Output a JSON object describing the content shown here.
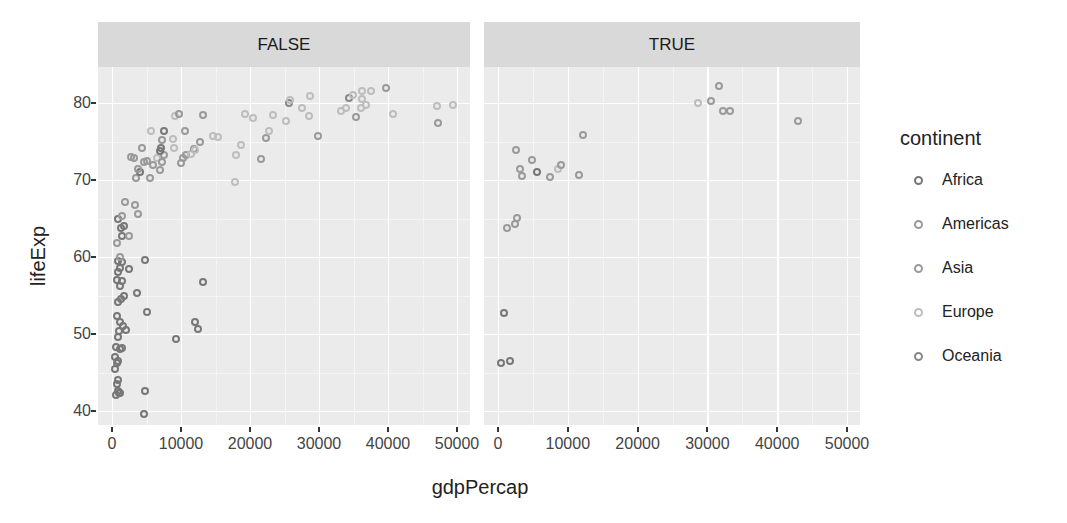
{
  "chart_data": {
    "type": "scatter",
    "title": "",
    "xlabel": "gdpPercap",
    "ylabel": "lifeExp",
    "facet_var": "",
    "facets": [
      "FALSE",
      "TRUE"
    ],
    "xlim": [
      -2000,
      52000
    ],
    "ylim": [
      38.5,
      85
    ],
    "x_ticks": [
      "0",
      "10000",
      "20000",
      "30000",
      "40000",
      "50000"
    ],
    "y_ticks": [
      "40",
      "50",
      "60",
      "70",
      "80"
    ],
    "grid": true,
    "legend": {
      "title": "continent",
      "position": "right",
      "entries": [
        {
          "name": "Africa",
          "color": "#777777"
        },
        {
          "name": "Americas",
          "color": "#999999"
        },
        {
          "name": "Asia",
          "color": "#9a9a9a"
        },
        {
          "name": "Europe",
          "color": "#bdbdbd"
        },
        {
          "name": "Oceania",
          "color": "#888888"
        }
      ]
    },
    "series": [
      {
        "facet": "FALSE",
        "points": [
          {
            "x": 600,
            "y": 42.1,
            "c": "Africa"
          },
          {
            "x": 800,
            "y": 42.6,
            "c": "Africa"
          },
          {
            "x": 1000,
            "y": 42.4,
            "c": "Africa"
          },
          {
            "x": 1200,
            "y": 42.3,
            "c": "Africa"
          },
          {
            "x": 700,
            "y": 43.5,
            "c": "Africa"
          },
          {
            "x": 900,
            "y": 44.0,
            "c": "Africa"
          },
          {
            "x": 4800,
            "y": 42.6,
            "c": "Africa"
          },
          {
            "x": 4700,
            "y": 39.6,
            "c": "Africa"
          },
          {
            "x": 500,
            "y": 45.4,
            "c": "Africa"
          },
          {
            "x": 700,
            "y": 46.2,
            "c": "Africa"
          },
          {
            "x": 400,
            "y": 47.0,
            "c": "Africa"
          },
          {
            "x": 900,
            "y": 46.5,
            "c": "Africa"
          },
          {
            "x": 600,
            "y": 48.3,
            "c": "Africa"
          },
          {
            "x": 1100,
            "y": 48.0,
            "c": "Africa"
          },
          {
            "x": 800,
            "y": 49.6,
            "c": "Africa"
          },
          {
            "x": 1500,
            "y": 48.2,
            "c": "Africa"
          },
          {
            "x": 9300,
            "y": 49.3,
            "c": "Africa"
          },
          {
            "x": 1000,
            "y": 50.4,
            "c": "Africa"
          },
          {
            "x": 1200,
            "y": 51.5,
            "c": "Africa"
          },
          {
            "x": 700,
            "y": 52.3,
            "c": "Africa"
          },
          {
            "x": 1600,
            "y": 51.0,
            "c": "Africa"
          },
          {
            "x": 2000,
            "y": 50.5,
            "c": "Africa"
          },
          {
            "x": 12000,
            "y": 51.6,
            "c": "Africa"
          },
          {
            "x": 12500,
            "y": 50.7,
            "c": "Africa"
          },
          {
            "x": 5000,
            "y": 52.9,
            "c": "Africa"
          },
          {
            "x": 900,
            "y": 54.1,
            "c": "Africa"
          },
          {
            "x": 1300,
            "y": 54.5,
            "c": "Africa"
          },
          {
            "x": 1800,
            "y": 55.0,
            "c": "Africa"
          },
          {
            "x": 3600,
            "y": 55.3,
            "c": "Africa"
          },
          {
            "x": 1100,
            "y": 56.2,
            "c": "Africa"
          },
          {
            "x": 700,
            "y": 57.0,
            "c": "Africa"
          },
          {
            "x": 13200,
            "y": 56.7,
            "c": "Africa"
          },
          {
            "x": 1400,
            "y": 56.9,
            "c": "Africa"
          },
          {
            "x": 800,
            "y": 58.0,
            "c": "Africa"
          },
          {
            "x": 2500,
            "y": 58.5,
            "c": "Africa"
          },
          {
            "x": 1200,
            "y": 58.6,
            "c": "Africa"
          },
          {
            "x": 900,
            "y": 59.5,
            "c": "Africa"
          },
          {
            "x": 1500,
            "y": 59.4,
            "c": "Africa"
          },
          {
            "x": 4800,
            "y": 59.6,
            "c": "Africa"
          },
          {
            "x": 1100,
            "y": 60.0,
            "c": "Asia"
          },
          {
            "x": 700,
            "y": 61.8,
            "c": "Asia"
          },
          {
            "x": 1500,
            "y": 62.7,
            "c": "Africa"
          },
          {
            "x": 2400,
            "y": 62.7,
            "c": "Asia"
          },
          {
            "x": 1300,
            "y": 63.8,
            "c": "Africa"
          },
          {
            "x": 1800,
            "y": 64.0,
            "c": "Africa"
          },
          {
            "x": 900,
            "y": 65.0,
            "c": "Africa"
          },
          {
            "x": 1500,
            "y": 65.3,
            "c": "Asia"
          },
          {
            "x": 3800,
            "y": 65.6,
            "c": "Asia"
          },
          {
            "x": 1900,
            "y": 67.2,
            "c": "Asia"
          },
          {
            "x": 3300,
            "y": 66.8,
            "c": "Americas"
          },
          {
            "x": 3500,
            "y": 70.3,
            "c": "Americas"
          },
          {
            "x": 5500,
            "y": 70.3,
            "c": "Asia"
          },
          {
            "x": 4100,
            "y": 71.0,
            "c": "Africa"
          },
          {
            "x": 3700,
            "y": 71.4,
            "c": "Americas"
          },
          {
            "x": 6900,
            "y": 71.3,
            "c": "Asia"
          },
          {
            "x": 5900,
            "y": 72.0,
            "c": "Americas"
          },
          {
            "x": 4700,
            "y": 72.3,
            "c": "Americas"
          },
          {
            "x": 3200,
            "y": 72.9,
            "c": "Americas"
          },
          {
            "x": 2800,
            "y": 73.0,
            "c": "Asia"
          },
          {
            "x": 5100,
            "y": 72.5,
            "c": "Americas"
          },
          {
            "x": 6500,
            "y": 72.8,
            "c": "Europe"
          },
          {
            "x": 7200,
            "y": 72.4,
            "c": "Americas"
          },
          {
            "x": 7500,
            "y": 73.3,
            "c": "Asia"
          },
          {
            "x": 4400,
            "y": 74.1,
            "c": "Asia"
          },
          {
            "x": 7000,
            "y": 73.8,
            "c": "Africa"
          },
          {
            "x": 7100,
            "y": 74.2,
            "c": "Africa"
          },
          {
            "x": 7300,
            "y": 75.2,
            "c": "Americas"
          },
          {
            "x": 5700,
            "y": 76.4,
            "c": "Europe"
          },
          {
            "x": 7500,
            "y": 76.4,
            "c": "Africa"
          },
          {
            "x": 8900,
            "y": 75.3,
            "c": "Europe"
          },
          {
            "x": 9000,
            "y": 74.2,
            "c": "Europe"
          },
          {
            "x": 10000,
            "y": 72.2,
            "c": "Americas"
          },
          {
            "x": 10300,
            "y": 72.8,
            "c": "Asia"
          },
          {
            "x": 10700,
            "y": 73.3,
            "c": "Americas"
          },
          {
            "x": 10600,
            "y": 76.4,
            "c": "Asia"
          },
          {
            "x": 11400,
            "y": 73.4,
            "c": "Europe"
          },
          {
            "x": 11900,
            "y": 74.0,
            "c": "Asia"
          },
          {
            "x": 12000,
            "y": 73.9,
            "c": "Europe"
          },
          {
            "x": 12800,
            "y": 75.0,
            "c": "Americas"
          },
          {
            "x": 9100,
            "y": 78.3,
            "c": "Europe"
          },
          {
            "x": 9700,
            "y": 78.6,
            "c": "Americas"
          },
          {
            "x": 13200,
            "y": 78.4,
            "c": "Americas"
          },
          {
            "x": 14700,
            "y": 75.7,
            "c": "Europe"
          },
          {
            "x": 15400,
            "y": 75.6,
            "c": "Europe"
          },
          {
            "x": 17800,
            "y": 69.8,
            "c": "Europe"
          },
          {
            "x": 18000,
            "y": 73.3,
            "c": "Europe"
          },
          {
            "x": 18700,
            "y": 74.5,
            "c": "Europe"
          },
          {
            "x": 19300,
            "y": 78.6,
            "c": "Europe"
          },
          {
            "x": 20500,
            "y": 78.1,
            "c": "Europe"
          },
          {
            "x": 21600,
            "y": 72.7,
            "c": "Asia"
          },
          {
            "x": 22300,
            "y": 75.5,
            "c": "Asia"
          },
          {
            "x": 22800,
            "y": 76.4,
            "c": "Europe"
          },
          {
            "x": 23300,
            "y": 78.5,
            "c": "Europe"
          },
          {
            "x": 25200,
            "y": 77.6,
            "c": "Europe"
          },
          {
            "x": 25600,
            "y": 80.0,
            "c": "Oceania"
          },
          {
            "x": 25800,
            "y": 80.4,
            "c": "Europe"
          },
          {
            "x": 27500,
            "y": 79.3,
            "c": "Europe"
          },
          {
            "x": 28700,
            "y": 80.9,
            "c": "Europe"
          },
          {
            "x": 28600,
            "y": 78.3,
            "c": "Europe"
          },
          {
            "x": 29800,
            "y": 75.7,
            "c": "Asia"
          },
          {
            "x": 33200,
            "y": 79.0,
            "c": "Europe"
          },
          {
            "x": 33900,
            "y": 79.3,
            "c": "Europe"
          },
          {
            "x": 34400,
            "y": 80.7,
            "c": "Oceania"
          },
          {
            "x": 34900,
            "y": 81.0,
            "c": "Europe"
          },
          {
            "x": 35300,
            "y": 78.2,
            "c": "Americas"
          },
          {
            "x": 36100,
            "y": 79.4,
            "c": "Europe"
          },
          {
            "x": 36300,
            "y": 80.5,
            "c": "Europe"
          },
          {
            "x": 36800,
            "y": 79.8,
            "c": "Europe"
          },
          {
            "x": 36200,
            "y": 81.6,
            "c": "Europe"
          },
          {
            "x": 37500,
            "y": 81.5,
            "c": "Europe"
          },
          {
            "x": 39700,
            "y": 82.0,
            "c": "Asia"
          },
          {
            "x": 40700,
            "y": 78.6,
            "c": "Europe"
          },
          {
            "x": 47100,
            "y": 79.6,
            "c": "Europe"
          },
          {
            "x": 47300,
            "y": 77.4,
            "c": "Americas"
          },
          {
            "x": 49400,
            "y": 79.8,
            "c": "Europe"
          }
        ]
      },
      {
        "facet": "TRUE",
        "points": [
          {
            "x": 400,
            "y": 46.2,
            "c": "Africa"
          },
          {
            "x": 1700,
            "y": 46.5,
            "c": "Africa"
          },
          {
            "x": 800,
            "y": 52.7,
            "c": "Africa"
          },
          {
            "x": 1300,
            "y": 63.8,
            "c": "Asia"
          },
          {
            "x": 2500,
            "y": 64.3,
            "c": "Asia"
          },
          {
            "x": 2700,
            "y": 65.1,
            "c": "Asia"
          },
          {
            "x": 2600,
            "y": 73.9,
            "c": "Asia"
          },
          {
            "x": 3100,
            "y": 71.4,
            "c": "Asia"
          },
          {
            "x": 3500,
            "y": 70.5,
            "c": "Asia"
          },
          {
            "x": 4900,
            "y": 72.6,
            "c": "Asia"
          },
          {
            "x": 5600,
            "y": 71.0,
            "c": "Africa"
          },
          {
            "x": 7500,
            "y": 70.4,
            "c": "Asia"
          },
          {
            "x": 8600,
            "y": 71.4,
            "c": "Europe"
          },
          {
            "x": 9000,
            "y": 72.0,
            "c": "Asia"
          },
          {
            "x": 11600,
            "y": 70.6,
            "c": "Asia"
          },
          {
            "x": 12200,
            "y": 75.8,
            "c": "Asia"
          },
          {
            "x": 28700,
            "y": 80.0,
            "c": "Europe"
          },
          {
            "x": 30500,
            "y": 80.2,
            "c": "Asia"
          },
          {
            "x": 31700,
            "y": 82.2,
            "c": "Asia"
          },
          {
            "x": 32200,
            "y": 78.9,
            "c": "Asia"
          },
          {
            "x": 33200,
            "y": 78.9,
            "c": "Asia"
          },
          {
            "x": 43000,
            "y": 77.6,
            "c": "Asia"
          }
        ]
      }
    ]
  }
}
